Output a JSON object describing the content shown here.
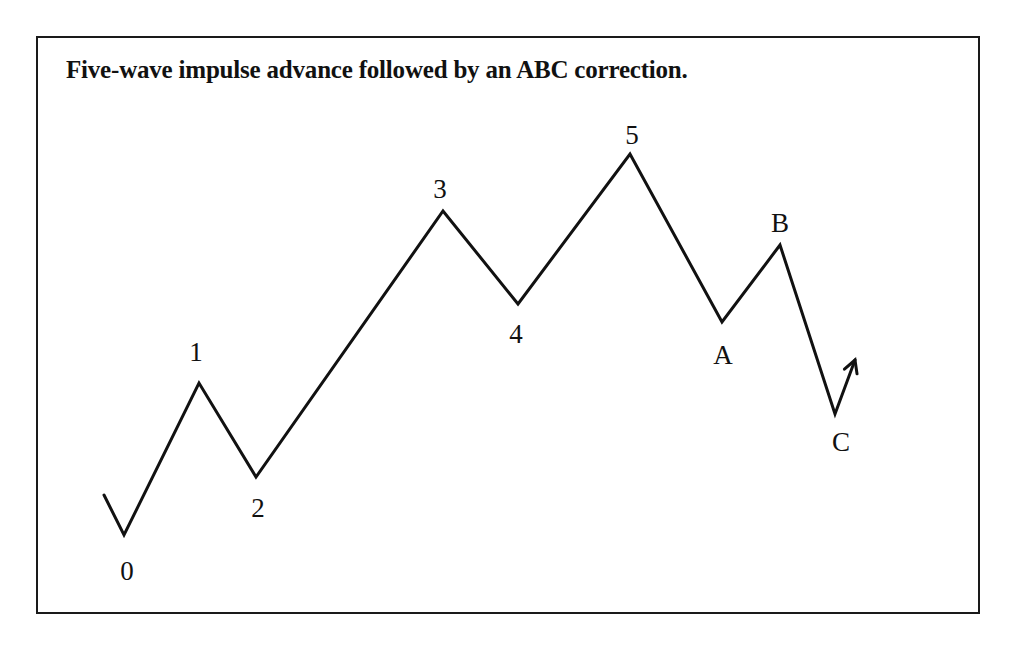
{
  "title": "Five-wave impulse advance followed by an ABC correction.",
  "colors": {
    "line": "#111111",
    "border": "#1a1a1a",
    "background": "#ffffff"
  },
  "path": {
    "start": [
      104,
      495
    ],
    "points": [
      {
        "id": "0",
        "x": 124,
        "y": 535,
        "label": "0",
        "lx": 127,
        "ly": 580
      },
      {
        "id": "1",
        "x": 199,
        "y": 383,
        "label": "1",
        "lx": 196,
        "ly": 361
      },
      {
        "id": "2",
        "x": 256,
        "y": 477,
        "label": "2",
        "lx": 258,
        "ly": 517
      },
      {
        "id": "3",
        "x": 443,
        "y": 211,
        "label": "3",
        "lx": 440,
        "ly": 198
      },
      {
        "id": "4",
        "x": 518,
        "y": 304,
        "label": "4",
        "lx": 516,
        "ly": 343
      },
      {
        "id": "5",
        "x": 630,
        "y": 154,
        "label": "5",
        "lx": 632,
        "ly": 144
      },
      {
        "id": "A",
        "x": 722,
        "y": 322,
        "label": "A",
        "lx": 723,
        "ly": 364
      },
      {
        "id": "B",
        "x": 780,
        "y": 245,
        "label": "B",
        "lx": 780,
        "ly": 232
      },
      {
        "id": "C",
        "x": 835,
        "y": 414,
        "label": "C",
        "lx": 841,
        "ly": 451
      }
    ],
    "arrow_tip": [
      855,
      360
    ]
  }
}
